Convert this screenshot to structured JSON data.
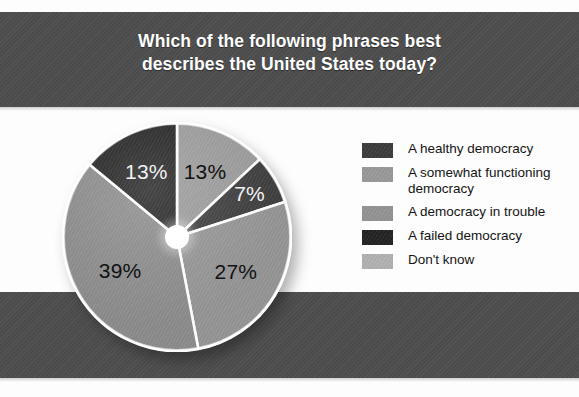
{
  "chart_data": {
    "type": "pie",
    "title": "Which of the following phrases best describes the United States today?",
    "title_line1": "Which of the following phrases best",
    "title_line2": "describes the United States today?",
    "categories": [
      "A somewhat functioning democracy",
      "A healthy democracy",
      "A democracy in trouble",
      "Don't know",
      "A failed democracy"
    ],
    "values": [
      13,
      7,
      27,
      39,
      13
    ],
    "value_labels": [
      "13%",
      "7%",
      "27%",
      "39%",
      "13%"
    ],
    "unit": "%",
    "xlabel": "",
    "ylabel": "",
    "legend_position": "right",
    "grid": false,
    "slices": [
      {
        "label": "A somewhat functioning democracy",
        "value": 13,
        "value_label": "13%",
        "color": "#9a9a9a",
        "label_color": "#111111",
        "start_angle": 0,
        "end_angle": 46.8
      },
      {
        "label": "A healthy democracy",
        "value": 7,
        "value_label": "7%",
        "color": "#3d3d3d",
        "label_color": "#f2f2f2",
        "start_angle": 46.8,
        "end_angle": 72.0
      },
      {
        "label": "A democracy in trouble",
        "value": 27,
        "value_label": "27%",
        "color": "#949494",
        "label_color": "#111111",
        "start_angle": 72.0,
        "end_angle": 169.2
      },
      {
        "label": "Don't know",
        "value": 39,
        "value_label": "39%",
        "color": "#8b8b8b",
        "label_color": "#111111",
        "start_angle": 169.2,
        "end_angle": 309.6
      },
      {
        "label": "A failed democracy",
        "value": 13,
        "value_label": "13%",
        "color": "#242424",
        "label_color": "#f2f2f2",
        "start_angle": 309.6,
        "end_angle": 360
      }
    ]
  },
  "legend": {
    "items": [
      {
        "label": "A healthy democracy",
        "color": "#3d3d3d"
      },
      {
        "label": "A somewhat functioning democracy",
        "color": "#9a9a9a"
      },
      {
        "label": "A democracy in trouble",
        "color": "#949494"
      },
      {
        "label": "A failed democracy",
        "color": "#242424"
      },
      {
        "label": "Don't know",
        "color": "#b2b2b2"
      }
    ]
  },
  "theme": {
    "band_color": "#4e4e4e",
    "page_background": "#fdfdfd",
    "title_color": "#ffffff",
    "legend_text_color": "#141414",
    "slice_divider_color": "#ffffff",
    "hub_color": "#ffffff"
  }
}
